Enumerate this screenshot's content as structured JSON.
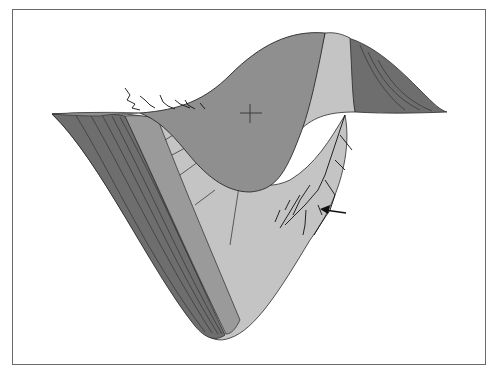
{
  "figure": {
    "annotations": {
      "crosshair": "crosshair marker",
      "arrow": "arrow pointer"
    },
    "colors": {
      "frame": "#6a6a6a",
      "dark_region": "#6e6e6e",
      "mid_region": "#8f8f8f",
      "light_region": "#c4c4c4",
      "outline": "#2a2a2a",
      "background": "#ffffff"
    }
  }
}
